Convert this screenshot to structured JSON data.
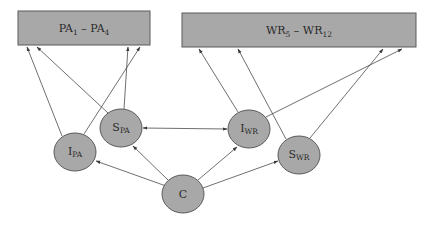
{
  "diagram": {
    "colors": {
      "fill": "#a8a8a8",
      "stroke": "#5a5a5a",
      "edge": "#4a4a4a",
      "background": "#ffffff"
    },
    "boxes": [
      {
        "id": "PA",
        "main1": "PA",
        "sub1": "1",
        "dash": " – ",
        "main2": "PA",
        "sub2": "4",
        "x": 18,
        "y": 11,
        "w": 132,
        "h": 34
      },
      {
        "id": "WR",
        "main1": "WR",
        "sub1": "5",
        "dash": " – ",
        "main2": "WR",
        "sub2": "12",
        "x": 182,
        "y": 13,
        "w": 234,
        "h": 34
      }
    ],
    "nodes": [
      {
        "id": "I_PA",
        "main": "I",
        "sub": "PA",
        "cx": 75,
        "cy": 152
      },
      {
        "id": "S_PA",
        "main": "S",
        "sub": "PA",
        "cx": 121,
        "cy": 128
      },
      {
        "id": "C",
        "main": "C",
        "sub": "",
        "cx": 183,
        "cy": 194
      },
      {
        "id": "I_WR",
        "main": "I",
        "sub": "WR",
        "cx": 249,
        "cy": 129
      },
      {
        "id": "S_WR",
        "main": "S",
        "sub": "WR",
        "cx": 299,
        "cy": 155
      }
    ],
    "edges": [
      {
        "from": "C",
        "to": "I_PA",
        "type": "directed"
      },
      {
        "from": "C",
        "to": "S_PA",
        "type": "directed"
      },
      {
        "from": "C",
        "to": "I_WR",
        "type": "directed"
      },
      {
        "from": "C",
        "to": "S_WR",
        "type": "directed"
      },
      {
        "from": "S_PA",
        "to": "I_WR",
        "type": "bidirectional"
      },
      {
        "from": "I_PA",
        "to": "PA",
        "type": "directed",
        "target_x": 27
      },
      {
        "from": "I_PA",
        "to": "PA",
        "type": "directed",
        "target_x": 140
      },
      {
        "from": "S_PA",
        "to": "PA",
        "type": "directed",
        "target_x": 37
      },
      {
        "from": "S_PA",
        "to": "PA",
        "type": "directed",
        "target_x": 128
      },
      {
        "from": "I_WR",
        "to": "WR",
        "type": "directed",
        "target_x": 199
      },
      {
        "from": "I_WR",
        "to": "WR",
        "type": "directed",
        "target_x": 402
      },
      {
        "from": "S_WR",
        "to": "WR",
        "type": "directed",
        "target_x": 238
      },
      {
        "from": "S_WR",
        "to": "WR",
        "type": "directed",
        "target_x": 383
      }
    ]
  }
}
